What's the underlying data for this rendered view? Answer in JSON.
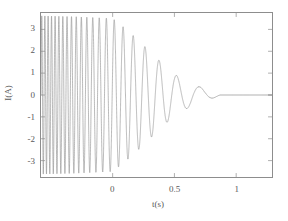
{
  "chart_data": {
    "type": "line",
    "title": "",
    "xlabel": "t(s)",
    "ylabel": "I(A)",
    "xlim": [
      -0.58,
      1.29
    ],
    "ylim": [
      -3.75,
      3.75
    ],
    "xticks": [
      0,
      0.5,
      1
    ],
    "xtick_labels": [
      "0",
      "0.5",
      "1"
    ],
    "yticks": [
      3,
      2,
      1,
      0,
      -1,
      -2,
      -3
    ],
    "ytick_labels": [
      "3",
      "2",
      "1",
      "0",
      "-1",
      "-2",
      "-3"
    ],
    "grid": false,
    "legend": null,
    "series": [
      {
        "name": "current",
        "color": "#8a8a8a",
        "line_width": 0.6,
        "description": "Damped chirped oscillation: amplitude decays from about 3.6 A to 0 A, oscillation frequency decreases from roughly 40 Hz to under 4 Hz, settling flat at 0 A after about t = 0.87 s",
        "model": {
          "start_t": -0.58,
          "end_t": 1.29,
          "settle_t": 0.87,
          "amplitude_start": 3.62,
          "amplitude_at_zero_t": 3.5,
          "decay_shape": "linear-envelope-to-zero",
          "freq_start_hz": 41.0,
          "freq_end_hz": 3.4,
          "final_value": 0
        },
        "envelope_points": [
          {
            "t": -0.58,
            "amplitude": 3.62
          },
          {
            "t": -0.3,
            "amplitude": 3.58
          },
          {
            "t": 0.0,
            "amplitude": 3.5
          },
          {
            "t": 0.1,
            "amplitude": 3.05
          },
          {
            "t": 0.2,
            "amplitude": 2.55
          },
          {
            "t": 0.3,
            "amplitude": 2.0
          },
          {
            "t": 0.4,
            "amplitude": 1.45
          },
          {
            "t": 0.5,
            "amplitude": 0.95
          },
          {
            "t": 0.6,
            "amplitude": 0.62
          },
          {
            "t": 0.7,
            "amplitude": 0.38
          },
          {
            "t": 0.8,
            "amplitude": 0.18
          },
          {
            "t": 0.87,
            "amplitude": 0.0
          },
          {
            "t": 1.29,
            "amplitude": 0.0
          }
        ]
      }
    ]
  },
  "axes": {
    "frame_color": "#8d8d8d",
    "tick_color": "#8d8d8d",
    "label_color": "#5a5a5a"
  }
}
